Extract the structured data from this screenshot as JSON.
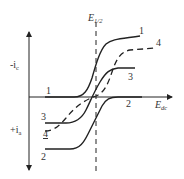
{
  "diagram": {
    "type": "polarographic-waves",
    "axes": {
      "y_top_label": "-i",
      "y_top_sub": "c",
      "y_bottom_label": "+i",
      "y_bottom_sub": "a",
      "x_label": "E",
      "x_sub": "dc"
    },
    "reference_line": {
      "label": "E",
      "sub": "1/2",
      "style": "dashed"
    },
    "curves": [
      {
        "id": "1",
        "style": "solid",
        "label": "1",
        "description": "cathodic wave"
      },
      {
        "id": "2",
        "style": "solid",
        "label": "2",
        "description": "anodic wave"
      },
      {
        "id": "3",
        "style": "solid",
        "label": "3",
        "description": "composite cathodic-anodic wave"
      },
      {
        "id": "4",
        "style": "dashed",
        "label": "4",
        "description": "irreversible composite wave"
      }
    ],
    "colors": {
      "line": "#222222",
      "text": "#333333",
      "background": "#ffffff"
    }
  }
}
